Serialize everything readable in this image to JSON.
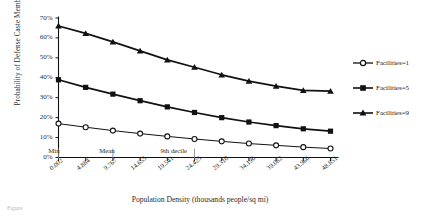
{
  "chart_data": {
    "type": "line",
    "title": "",
    "xlabel": "Population Density (thousands people/sq mi)",
    "ylabel": "Probability of Defense Caste Membership",
    "x": [
      0.002,
      4.884,
      9.767,
      14.655,
      19.541,
      24.425,
      29.31,
      34.196,
      39.082,
      43.966,
      48.851
    ],
    "xticklabels": [
      "0.002",
      "4.884",
      "9.767",
      "14.655",
      "19.541",
      "24.425",
      "29.310",
      "34.196",
      "39.082",
      "43.966",
      "48.851"
    ],
    "yticklabels": [
      "0%",
      "10%",
      "20%",
      "30%",
      "40%",
      "50%",
      "60%",
      "70%"
    ],
    "yticks": [
      0,
      10,
      20,
      30,
      40,
      50,
      60,
      70
    ],
    "ylim": [
      0,
      70
    ],
    "grid": false,
    "legend_position": "right",
    "series": [
      {
        "name": "Facilities=1",
        "marker": "open-circle",
        "values": [
          17.0,
          15.2,
          13.5,
          12.0,
          10.6,
          9.3,
          8.1,
          7.0,
          6.1,
          5.2,
          4.5
        ]
      },
      {
        "name": "Facilities=5",
        "marker": "filled-square",
        "values": [
          39.0,
          35.2,
          31.8,
          28.5,
          25.4,
          22.6,
          20.0,
          17.8,
          16.0,
          14.4,
          13.2
        ]
      },
      {
        "name": "Facilities=9",
        "marker": "filled-triangle",
        "values": [
          66.0,
          62.3,
          58.0,
          53.5,
          49.0,
          45.3,
          41.5,
          38.3,
          35.8,
          33.7,
          33.3
        ]
      }
    ],
    "annotations": [
      {
        "label": "Min",
        "x_index": 0
      },
      {
        "label": "Mean",
        "x_index": 2
      },
      {
        "label": "9th decile",
        "x_index": 5
      }
    ]
  },
  "legend": {
    "items": [
      {
        "label": "Facilities=1"
      },
      {
        "label": "Facilities=5"
      },
      {
        "label": "Facilities=9"
      }
    ]
  },
  "caption": {
    "text": "Figure"
  }
}
